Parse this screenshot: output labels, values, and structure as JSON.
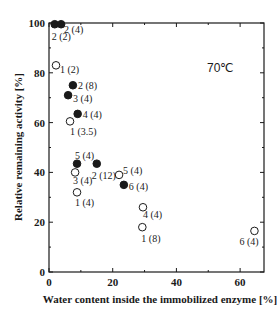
{
  "chart_data": {
    "type": "scatter",
    "title": "",
    "annotation": "70℃",
    "xlabel": "Water content inside the immobilized enzyme [%]",
    "ylabel": "Relative remaining activity [%]",
    "xlim": [
      0,
      67.5
    ],
    "ylim": [
      0,
      100
    ],
    "xticks": [
      0,
      20,
      40,
      60
    ],
    "xminor": [
      10,
      30,
      50
    ],
    "yticks": [
      0,
      20,
      40,
      60,
      80,
      100
    ],
    "yminor": [
      10,
      30,
      50,
      70,
      90
    ],
    "grid": false,
    "legend": null,
    "series": [
      {
        "name": "filled",
        "marker": "filled-circle",
        "points": [
          {
            "x": 1.8,
            "y": 99.5,
            "label": "2 (2)"
          },
          {
            "x": 3.8,
            "y": 99.5,
            "label": "2 (4)"
          },
          {
            "x": 7.5,
            "y": 75,
            "label": "2 (8)"
          },
          {
            "x": 6.0,
            "y": 71,
            "label": "3 (4)"
          },
          {
            "x": 9.0,
            "y": 63.5,
            "label": "4 (4)"
          },
          {
            "x": 8.8,
            "y": 43.5,
            "label": "5 (4)"
          },
          {
            "x": 15.0,
            "y": 43.5,
            "label": "2 (12)"
          },
          {
            "x": 23.5,
            "y": 35,
            "label": "6 (4)"
          }
        ]
      },
      {
        "name": "open",
        "marker": "open-circle",
        "points": [
          {
            "x": 2.2,
            "y": 83,
            "label": "1 (2)"
          },
          {
            "x": 6.6,
            "y": 60.5,
            "label": "1 (3.5)"
          },
          {
            "x": 8.2,
            "y": 40,
            "label": "3 (4)"
          },
          {
            "x": 8.8,
            "y": 32,
            "label": "1 (4)"
          },
          {
            "x": 22.0,
            "y": 39,
            "label": "5 (4)"
          },
          {
            "x": 29.5,
            "y": 26,
            "label": "4 (4)"
          },
          {
            "x": 29.3,
            "y": 18,
            "label": "1 (8)"
          },
          {
            "x": 64.5,
            "y": 16.5,
            "label": "6 (4)"
          }
        ]
      }
    ]
  },
  "layout": {
    "plot": {
      "left": 49,
      "right": 264,
      "top": 23,
      "bottom": 272
    },
    "colors": {
      "ink": "#1a1a1a",
      "background": "#ffffff"
    }
  },
  "label_offsets": [
    {
      "series": 0,
      "index": 0,
      "dx": -3,
      "dy": 16
    },
    {
      "series": 0,
      "index": 1,
      "dx": 3,
      "dy": 9
    },
    {
      "series": 0,
      "index": 2,
      "dx": 5,
      "dy": 4
    },
    {
      "series": 0,
      "index": 3,
      "dx": 5,
      "dy": 7
    },
    {
      "series": 0,
      "index": 4,
      "dx": 5,
      "dy": 4
    },
    {
      "series": 0,
      "index": 5,
      "dx": -2,
      "dy": -5
    },
    {
      "series": 0,
      "index": 6,
      "dx": -5,
      "dy": 15
    },
    {
      "series": 0,
      "index": 7,
      "dx": 5,
      "dy": 5
    },
    {
      "series": 1,
      "index": 0,
      "dx": 4,
      "dy": 8
    },
    {
      "series": 1,
      "index": 1,
      "dx": 0,
      "dy": 14
    },
    {
      "series": 1,
      "index": 2,
      "dx": -2,
      "dy": 12
    },
    {
      "series": 1,
      "index": 3,
      "dx": -2,
      "dy": 14
    },
    {
      "series": 1,
      "index": 4,
      "dx": 4,
      "dy": -1
    },
    {
      "series": 1,
      "index": 5,
      "dx": 0,
      "dy": 11
    },
    {
      "series": 1,
      "index": 6,
      "dx": -1,
      "dy": 15
    },
    {
      "series": 1,
      "index": 7,
      "dx": -15,
      "dy": 14
    }
  ]
}
